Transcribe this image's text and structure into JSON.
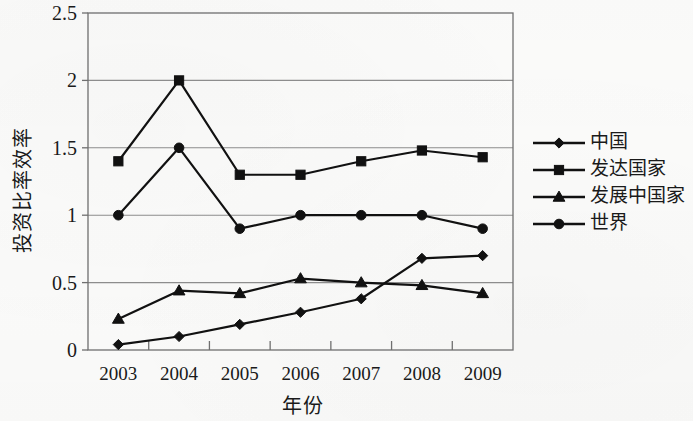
{
  "chart_data": {
    "type": "line",
    "title": "",
    "xlabel": "年份",
    "ylabel": "投资比率效率",
    "categories": [
      "2003",
      "2004",
      "2005",
      "2006",
      "2007",
      "2008",
      "2009"
    ],
    "ylim": [
      0,
      2.5
    ],
    "yticks": [
      "0",
      "0.5",
      "1",
      "1.5",
      "2",
      "2.5"
    ],
    "ytick_values": [
      0,
      0.5,
      1,
      1.5,
      2,
      2.5
    ],
    "grid": "horizontal",
    "legend_position": "right",
    "series": [
      {
        "name": "中国",
        "marker": "diamond",
        "values": [
          0.04,
          0.1,
          0.19,
          0.28,
          0.38,
          0.68,
          0.7
        ]
      },
      {
        "name": "发达国家",
        "marker": "square",
        "values": [
          1.4,
          2.0,
          1.3,
          1.3,
          1.4,
          1.48,
          1.43
        ]
      },
      {
        "name": "发展中国家",
        "marker": "triangle",
        "values": [
          0.23,
          0.44,
          0.42,
          0.53,
          0.5,
          0.48,
          0.42
        ]
      },
      {
        "name": "世界",
        "marker": "circle",
        "values": [
          1.0,
          1.5,
          0.9,
          1.0,
          1.0,
          1.0,
          0.9
        ]
      }
    ],
    "colors": {
      "series_line": "#111111",
      "marker": "#111111",
      "grid": "#8d8d8d",
      "frame": "#6f6f6f",
      "background": "#fbfbfa"
    }
  }
}
